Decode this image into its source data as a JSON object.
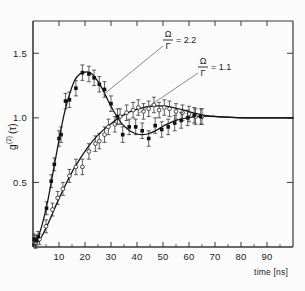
{
  "figure": {
    "kind": "scientific-plot",
    "background": "#fbfbfb",
    "frame_color": "#3a3a3a",
    "ink_color": "#1a1a1a"
  },
  "axes": {
    "x": {
      "label": "time [ns]",
      "ticks": [
        10,
        20,
        30,
        40,
        50,
        60,
        70,
        80,
        90
      ],
      "tick_labels": [
        "10",
        "20",
        "30",
        "40",
        "50",
        "60",
        "70",
        "80",
        "90"
      ],
      "min": 0,
      "max": 100
    },
    "y": {
      "label": "g",
      "label_sup": "(2)",
      "label_arg": "(τ)",
      "label_full": "g(2)(τ)",
      "ticks": [
        0.5,
        1.0,
        1.5
      ],
      "tick_labels": [
        "0.5",
        "1.0",
        "1.5"
      ],
      "min": 0,
      "max": 1.75
    }
  },
  "annotations": [
    {
      "id": "annot-omega-2p2",
      "numerator": "Ω",
      "denominator": "Γ",
      "equals": "= 2.2",
      "text": "Ω/Γ = 2.2",
      "label_x": 168,
      "label_y": 39,
      "leader_from_x": 163,
      "leader_from_y": 46,
      "leader_to_x": 103,
      "leader_to_y": 95
    },
    {
      "id": "annot-omega-1p1",
      "numerator": "Ω",
      "denominator": "Γ",
      "equals": "= 1.1",
      "text": "Ω/Γ = 1.1",
      "label_x": 203,
      "label_y": 66,
      "leader_from_x": 198,
      "leader_from_y": 73,
      "leader_to_x": 139,
      "leader_to_y": 113
    }
  ],
  "chart_data": {
    "type": "scatter",
    "title": "",
    "xlabel": "time [ns]",
    "ylabel": "g(2)(τ)",
    "xlim": [
      0,
      100
    ],
    "ylim": [
      0,
      1.75
    ],
    "grid": false,
    "legend_position": "in-plot-annotations",
    "series": [
      {
        "name": "Ω/Γ = 2.2",
        "marker": "filled-square",
        "marker_color": "#111111",
        "curve_color": "#111111",
        "has_errorbars": true,
        "points": [
          {
            "x": 0.5,
            "y": 0.06,
            "err": 0.04
          },
          {
            "x": 1.2,
            "y": 0.05,
            "err": 0.04
          },
          {
            "x": 2.0,
            "y": 0.08,
            "err": 0.04
          },
          {
            "x": 5.2,
            "y": 0.3,
            "err": 0.05
          },
          {
            "x": 7.0,
            "y": 0.51,
            "err": 0.05
          },
          {
            "x": 8.2,
            "y": 0.64,
            "err": 0.05
          },
          {
            "x": 10.0,
            "y": 0.84,
            "err": 0.06
          },
          {
            "x": 10.8,
            "y": 0.87,
            "err": 0.06
          },
          {
            "x": 12.5,
            "y": 1.13,
            "err": 0.06
          },
          {
            "x": 14.0,
            "y": 1.14,
            "err": 0.06
          },
          {
            "x": 16.5,
            "y": 1.23,
            "err": 0.06
          },
          {
            "x": 19.0,
            "y": 1.35,
            "err": 0.06
          },
          {
            "x": 21.5,
            "y": 1.34,
            "err": 0.06
          },
          {
            "x": 23.5,
            "y": 1.31,
            "err": 0.06
          },
          {
            "x": 25.5,
            "y": 1.26,
            "err": 0.06
          },
          {
            "x": 27.5,
            "y": 1.22,
            "err": 0.06
          },
          {
            "x": 30.0,
            "y": 1.11,
            "err": 0.06
          },
          {
            "x": 32.5,
            "y": 1.01,
            "err": 0.06
          },
          {
            "x": 34.5,
            "y": 0.87,
            "err": 0.06
          },
          {
            "x": 37.0,
            "y": 0.93,
            "err": 0.06
          },
          {
            "x": 39.5,
            "y": 0.93,
            "err": 0.06
          },
          {
            "x": 42.0,
            "y": 0.9,
            "err": 0.06
          },
          {
            "x": 44.5,
            "y": 0.84,
            "err": 0.06
          },
          {
            "x": 47.0,
            "y": 0.94,
            "err": 0.06
          },
          {
            "x": 49.5,
            "y": 0.91,
            "err": 0.06
          },
          {
            "x": 52.0,
            "y": 0.93,
            "err": 0.06
          },
          {
            "x": 54.5,
            "y": 0.96,
            "err": 0.06
          },
          {
            "x": 57.0,
            "y": 0.98,
            "err": 0.06
          },
          {
            "x": 59.5,
            "y": 1.0,
            "err": 0.06
          },
          {
            "x": 62.0,
            "y": 1.02,
            "err": 0.06
          },
          {
            "x": 64.5,
            "y": 1.01,
            "err": 0.06
          }
        ],
        "fit_curve": [
          {
            "x": 0,
            "y": 0.02
          },
          {
            "x": 2,
            "y": 0.08
          },
          {
            "x": 4,
            "y": 0.21
          },
          {
            "x": 6,
            "y": 0.39
          },
          {
            "x": 8,
            "y": 0.61
          },
          {
            "x": 10,
            "y": 0.83
          },
          {
            "x": 12,
            "y": 1.03
          },
          {
            "x": 14,
            "y": 1.18
          },
          {
            "x": 16,
            "y": 1.29
          },
          {
            "x": 18,
            "y": 1.34
          },
          {
            "x": 20,
            "y": 1.355
          },
          {
            "x": 22,
            "y": 1.35
          },
          {
            "x": 24,
            "y": 1.31
          },
          {
            "x": 26,
            "y": 1.25
          },
          {
            "x": 28,
            "y": 1.17
          },
          {
            "x": 30,
            "y": 1.09
          },
          {
            "x": 32,
            "y": 1.02
          },
          {
            "x": 34,
            "y": 0.96
          },
          {
            "x": 36,
            "y": 0.92
          },
          {
            "x": 38,
            "y": 0.89
          },
          {
            "x": 40,
            "y": 0.875
          },
          {
            "x": 42,
            "y": 0.87
          },
          {
            "x": 44,
            "y": 0.875
          },
          {
            "x": 46,
            "y": 0.89
          },
          {
            "x": 48,
            "y": 0.91
          },
          {
            "x": 50,
            "y": 0.935
          },
          {
            "x": 52,
            "y": 0.955
          },
          {
            "x": 55,
            "y": 0.98
          },
          {
            "x": 58,
            "y": 0.995
          },
          {
            "x": 61,
            "y": 1.005
          },
          {
            "x": 64,
            "y": 1.012
          },
          {
            "x": 68,
            "y": 1.012
          },
          {
            "x": 72,
            "y": 1.008
          },
          {
            "x": 78,
            "y": 1.002
          },
          {
            "x": 85,
            "y": 1.0
          },
          {
            "x": 93,
            "y": 1.0
          },
          {
            "x": 100,
            "y": 1.0
          }
        ]
      },
      {
        "name": "Ω/Γ = 1.1",
        "marker": "open-circle",
        "marker_color": "#222222",
        "curve_color": "#111111",
        "has_errorbars": true,
        "points": [
          {
            "x": 1.0,
            "y": 0.03,
            "err": 0.04
          },
          {
            "x": 2.5,
            "y": 0.06,
            "err": 0.04
          },
          {
            "x": 5.0,
            "y": 0.16,
            "err": 0.05
          },
          {
            "x": 7.5,
            "y": 0.29,
            "err": 0.05
          },
          {
            "x": 9.5,
            "y": 0.38,
            "err": 0.05
          },
          {
            "x": 11.5,
            "y": 0.45,
            "err": 0.05
          },
          {
            "x": 14.0,
            "y": 0.55,
            "err": 0.05
          },
          {
            "x": 16.5,
            "y": 0.62,
            "err": 0.06
          },
          {
            "x": 19.0,
            "y": 0.62,
            "err": 0.06
          },
          {
            "x": 21.5,
            "y": 0.74,
            "err": 0.06
          },
          {
            "x": 24.0,
            "y": 0.8,
            "err": 0.06
          },
          {
            "x": 25.5,
            "y": 0.82,
            "err": 0.06
          },
          {
            "x": 27.5,
            "y": 0.87,
            "err": 0.06
          },
          {
            "x": 29.0,
            "y": 0.93,
            "err": 0.06
          },
          {
            "x": 31.5,
            "y": 0.95,
            "err": 0.06
          },
          {
            "x": 33.5,
            "y": 1.01,
            "err": 0.06
          },
          {
            "x": 36.0,
            "y": 1.04,
            "err": 0.06
          },
          {
            "x": 38.5,
            "y": 1.06,
            "err": 0.06
          },
          {
            "x": 40.5,
            "y": 1.08,
            "err": 0.06
          },
          {
            "x": 42.5,
            "y": 1.05,
            "err": 0.06
          },
          {
            "x": 44.5,
            "y": 1.07,
            "err": 0.06
          },
          {
            "x": 46.5,
            "y": 1.1,
            "err": 0.06
          },
          {
            "x": 48.5,
            "y": 1.06,
            "err": 0.06
          },
          {
            "x": 50.5,
            "y": 1.08,
            "err": 0.06
          },
          {
            "x": 52.5,
            "y": 1.07,
            "err": 0.06
          },
          {
            "x": 55.0,
            "y": 1.05,
            "err": 0.06
          },
          {
            "x": 57.5,
            "y": 1.04,
            "err": 0.06
          },
          {
            "x": 60.0,
            "y": 1.03,
            "err": 0.06
          },
          {
            "x": 62.5,
            "y": 1.01,
            "err": 0.06
          },
          {
            "x": 65.0,
            "y": 1.01,
            "err": 0.06
          }
        ],
        "fit_curve": [
          {
            "x": 0,
            "y": 0.01
          },
          {
            "x": 3,
            "y": 0.07
          },
          {
            "x": 6,
            "y": 0.19
          },
          {
            "x": 9,
            "y": 0.33
          },
          {
            "x": 12,
            "y": 0.46
          },
          {
            "x": 15,
            "y": 0.58
          },
          {
            "x": 18,
            "y": 0.68
          },
          {
            "x": 21,
            "y": 0.77
          },
          {
            "x": 24,
            "y": 0.845
          },
          {
            "x": 27,
            "y": 0.905
          },
          {
            "x": 30,
            "y": 0.955
          },
          {
            "x": 33,
            "y": 1.0
          },
          {
            "x": 36,
            "y": 1.035
          },
          {
            "x": 39,
            "y": 1.06
          },
          {
            "x": 42,
            "y": 1.078
          },
          {
            "x": 45,
            "y": 1.088
          },
          {
            "x": 48,
            "y": 1.092
          },
          {
            "x": 51,
            "y": 1.09
          },
          {
            "x": 54,
            "y": 1.08
          },
          {
            "x": 57,
            "y": 1.065
          },
          {
            "x": 60,
            "y": 1.048
          },
          {
            "x": 63,
            "y": 1.032
          },
          {
            "x": 66,
            "y": 1.02
          },
          {
            "x": 70,
            "y": 1.012
          },
          {
            "x": 75,
            "y": 1.005
          },
          {
            "x": 82,
            "y": 1.0
          },
          {
            "x": 90,
            "y": 1.0
          },
          {
            "x": 100,
            "y": 1.0
          }
        ]
      }
    ]
  }
}
